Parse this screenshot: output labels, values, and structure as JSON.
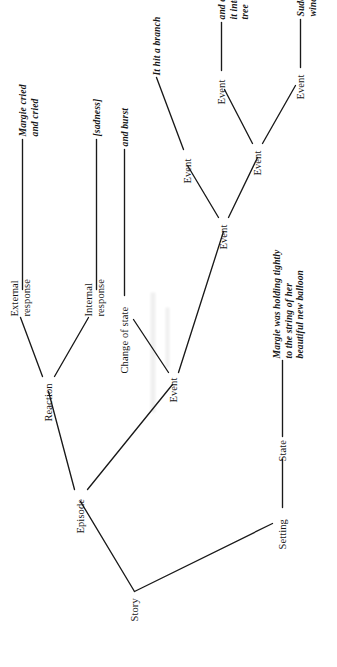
{
  "figure": {
    "kind": "story-grammar-tree",
    "orientation": "rotated-90-ccw",
    "background_color": "#ffffff",
    "line_color": "#1a1a1a",
    "text_color": "#161616"
  },
  "page": {
    "number": ""
  },
  "nodes": {
    "story": {
      "label": "Story",
      "type": "category"
    },
    "setting": {
      "label": "Setting",
      "type": "category"
    },
    "state": {
      "label": "State",
      "type": "category"
    },
    "setting_terminal": {
      "label": "Margie was holding tightly to the string of her beautiful new balloon",
      "type": "terminal"
    },
    "episode": {
      "label": "Episode",
      "type": "category"
    },
    "event_top": {
      "label": "Event",
      "type": "category"
    },
    "reaction": {
      "label": "Reaction",
      "type": "category"
    },
    "change_of_state": {
      "label": "Change of state",
      "type": "category"
    },
    "change_terminal": {
      "label": "and burst",
      "type": "terminal"
    },
    "event_mid": {
      "label": "Event",
      "type": "category"
    },
    "event_branch": {
      "label": "Event",
      "type": "category"
    },
    "branch_terminal": {
      "label": "It hit a branch",
      "type": "terminal"
    },
    "event_lower": {
      "label": "Event",
      "type": "category"
    },
    "event_carried": {
      "label": "Event",
      "type": "category"
    },
    "carried_terminal": {
      "label": "and carried it into a tree",
      "type": "terminal"
    },
    "event_gust": {
      "label": "Event",
      "type": "category"
    },
    "gust_terminal": {
      "label": "Suddenly, a gust of wind caught it",
      "type": "terminal"
    },
    "internal_response": {
      "label": "Internal response",
      "type": "category"
    },
    "internal_terminal": {
      "label": "[sadness]",
      "type": "terminal"
    },
    "external_response": {
      "label": "External response",
      "type": "category"
    },
    "external_terminal": {
      "label": "Margie cried and cried",
      "type": "terminal"
    }
  },
  "node_lines": {
    "setting_terminal": [
      "Margie was holding tightly",
      "to the string of her",
      "beautiful new balloon"
    ],
    "carried_terminal": [
      "and carried",
      "it into a",
      "tree"
    ],
    "gust_terminal": [
      "Suddenly, a gust of",
      "wind caught it"
    ],
    "external_terminal": [
      "Margie cried",
      "and cried"
    ],
    "internal_response": [
      "Internal",
      "response"
    ],
    "external_response": [
      "External",
      "response"
    ]
  },
  "edges": [
    {
      "from": "story",
      "to": "setting"
    },
    {
      "from": "story",
      "to": "episode"
    },
    {
      "from": "setting",
      "to": "state"
    },
    {
      "from": "state",
      "to": "setting_terminal"
    },
    {
      "from": "episode",
      "to": "event_top"
    },
    {
      "from": "episode",
      "to": "reaction"
    },
    {
      "from": "event_top",
      "to": "event_mid"
    },
    {
      "from": "event_top",
      "to": "change_of_state"
    },
    {
      "from": "change_of_state",
      "to": "change_terminal"
    },
    {
      "from": "event_mid",
      "to": "event_lower"
    },
    {
      "from": "event_mid",
      "to": "event_branch"
    },
    {
      "from": "event_branch",
      "to": "branch_terminal"
    },
    {
      "from": "event_lower",
      "to": "event_gust"
    },
    {
      "from": "event_lower",
      "to": "event_carried"
    },
    {
      "from": "event_carried",
      "to": "carried_terminal"
    },
    {
      "from": "event_gust",
      "to": "gust_terminal"
    },
    {
      "from": "reaction",
      "to": "internal_response"
    },
    {
      "from": "reaction",
      "to": "external_response"
    },
    {
      "from": "internal_response",
      "to": "internal_terminal"
    },
    {
      "from": "external_response",
      "to": "external_terminal"
    }
  ]
}
